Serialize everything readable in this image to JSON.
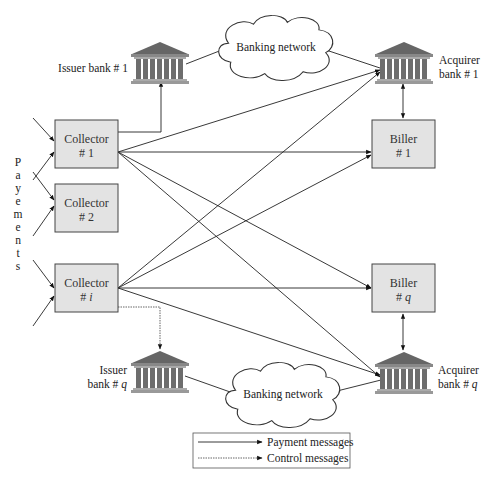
{
  "diagram": {
    "title": "",
    "issuer_bank_1": {
      "line1": "Issuer bank # 1"
    },
    "acquirer_bank_1": {
      "line1": "Acquirer",
      "line2": "bank # 1"
    },
    "issuer_bank_q": {
      "line1": "Issuer",
      "line2_prefix": "bank # ",
      "line2_var": "q"
    },
    "acquirer_bank_q": {
      "line1": "Acquirer",
      "line2_prefix": "bank # ",
      "line2_var": "q"
    },
    "banking_network_top": "Banking network",
    "banking_network_bottom": "Banking network",
    "collectors": [
      {
        "line1": "Collector",
        "line2_prefix": "# ",
        "line2_var": "1",
        "italic": false
      },
      {
        "line1": "Collector",
        "line2_prefix": "# ",
        "line2_var": "2",
        "italic": false
      },
      {
        "line1": "Collector",
        "line2_prefix": "# ",
        "line2_var": "i",
        "italic": true
      }
    ],
    "billers": [
      {
        "line1": "Biller",
        "line2_prefix": "# ",
        "line2_var": "1",
        "italic": false
      },
      {
        "line1": "Biller",
        "line2_prefix": "# ",
        "line2_var": "q",
        "italic": true
      }
    ],
    "payments_label": [
      "P",
      "a",
      "y",
      "e",
      "m",
      "e",
      "n",
      "t",
      "s"
    ],
    "legend": {
      "payment": "Payment messages",
      "control": "Control messages"
    },
    "edges": [
      {
        "from": "collector-1",
        "to": "issuer-bank-1",
        "type": "payment"
      },
      {
        "from": "issuer-bank-1",
        "to": "banking-network-top",
        "type": "link"
      },
      {
        "from": "banking-network-top",
        "to": "acquirer-bank-1",
        "type": "link"
      },
      {
        "from": "collector-1",
        "to": "acquirer-bank-1",
        "type": "payment"
      },
      {
        "from": "collector-1",
        "to": "biller-1",
        "type": "payment"
      },
      {
        "from": "collector-1",
        "to": "biller-q",
        "type": "payment"
      },
      {
        "from": "collector-1",
        "to": "acquirer-bank-q",
        "type": "payment"
      },
      {
        "from": "collector-i",
        "to": "acquirer-bank-1",
        "type": "payment"
      },
      {
        "from": "collector-i",
        "to": "biller-1",
        "type": "payment"
      },
      {
        "from": "collector-i",
        "to": "biller-q",
        "type": "payment"
      },
      {
        "from": "collector-i",
        "to": "acquirer-bank-q",
        "type": "payment"
      },
      {
        "from": "collector-i",
        "to": "issuer-bank-q",
        "type": "control"
      },
      {
        "from": "issuer-bank-q",
        "to": "banking-network-bottom",
        "type": "link"
      },
      {
        "from": "banking-network-bottom",
        "to": "acquirer-bank-q",
        "type": "link"
      },
      {
        "from": "biller-1",
        "to": "acquirer-bank-1",
        "type": "bidirectional"
      },
      {
        "from": "biller-q",
        "to": "acquirer-bank-q",
        "type": "bidirectional"
      }
    ]
  }
}
